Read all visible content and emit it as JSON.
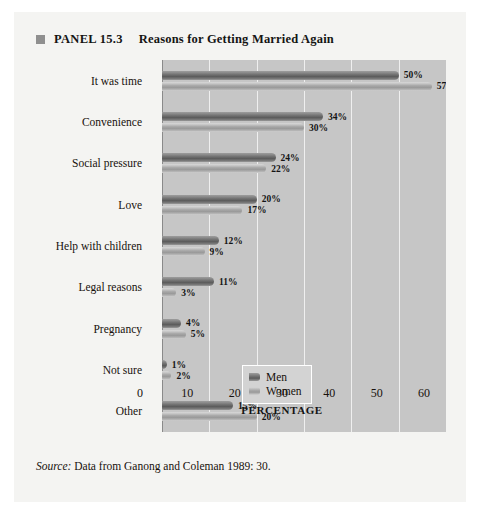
{
  "panel": {
    "bullet_icon": "square-bullet-icon",
    "label": "PANEL 15.3",
    "title": "Reasons for Getting Married Again"
  },
  "source": {
    "label": "Source:",
    "text": "Data from Ganong and Coleman 1989: 30."
  },
  "legend": {
    "position": "inside-bottom-right",
    "entries": [
      {
        "name": "Men",
        "color": "#6f6f6f"
      },
      {
        "name": "Women",
        "color": "#a6a6a6"
      }
    ]
  },
  "chart_data": {
    "type": "bar",
    "orientation": "horizontal",
    "title": "Reasons for Getting Married Again",
    "xlabel": "PERCENTAGE",
    "ylabel": "",
    "xlim": [
      0,
      60
    ],
    "xticks": [
      0,
      10,
      20,
      30,
      40,
      50,
      60
    ],
    "xtick_labels": [
      "0",
      "10",
      "20",
      "30",
      "40",
      "50",
      "60"
    ],
    "grid": true,
    "grid_axis": "x",
    "legend_position": "lower right",
    "value_suffix": "%",
    "categories": [
      "It was time",
      "Convenience",
      "Social pressure",
      "Love",
      "Help with children",
      "Legal reasons",
      "Pregnancy",
      "Not sure",
      "Other"
    ],
    "series": [
      {
        "name": "Men",
        "color": "#6f6f6f",
        "values": [
          50,
          34,
          24,
          20,
          12,
          11,
          4,
          1,
          15
        ],
        "labels": [
          "50%",
          "34%",
          "24%",
          "20%",
          "12%",
          "11%",
          "4%",
          "1%",
          "15%"
        ]
      },
      {
        "name": "Women",
        "color": "#a6a6a6",
        "values": [
          57,
          30,
          22,
          17,
          9,
          3,
          5,
          2,
          20
        ],
        "labels": [
          "57%",
          "30%",
          "22%",
          "17%",
          "9%",
          "3%",
          "5%",
          "2%",
          "20%"
        ]
      }
    ]
  }
}
